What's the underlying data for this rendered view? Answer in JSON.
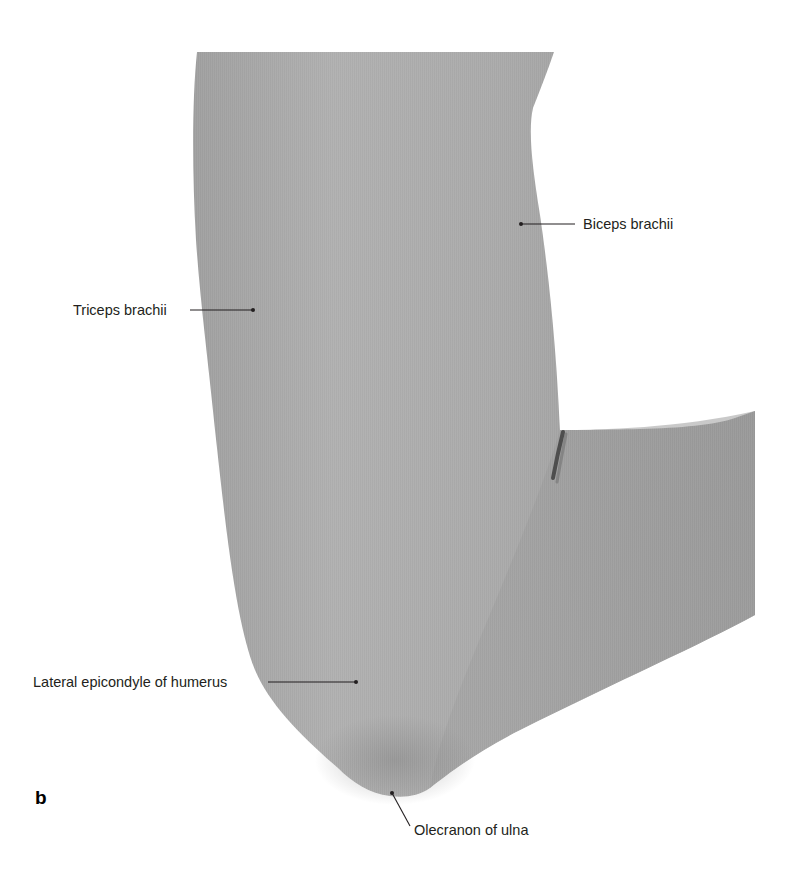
{
  "figure": {
    "panel_letter": "b",
    "colors": {
      "skin_base": "#a6a6a6",
      "skin_light": "#b8b8b8",
      "skin_dark": "#8f8f8f",
      "crease": "#3a3a3a",
      "label_text": "#231f20",
      "leader_line": "#231f20",
      "background": "#ffffff"
    },
    "labels": [
      {
        "id": "biceps",
        "text": "Biceps brachii",
        "text_x": 583,
        "text_y": 217,
        "line": [
          [
            521,
            224
          ],
          [
            575,
            224
          ]
        ]
      },
      {
        "id": "triceps",
        "text": "Triceps brachii",
        "text_x": 73,
        "text_y": 304,
        "line": [
          [
            190,
            310
          ],
          [
            253,
            310
          ]
        ]
      },
      {
        "id": "lateral-epicondyle",
        "text": "Lateral epicondyle of humerus",
        "text_x": 33,
        "text_y": 675,
        "line": [
          [
            268,
            682
          ],
          [
            356,
            682
          ]
        ]
      },
      {
        "id": "olecranon",
        "text": "Olecranon of ulna",
        "text_x": 413,
        "text_y": 824,
        "line": [
          [
            392,
            793
          ],
          [
            410,
            826
          ]
        ]
      }
    ]
  }
}
